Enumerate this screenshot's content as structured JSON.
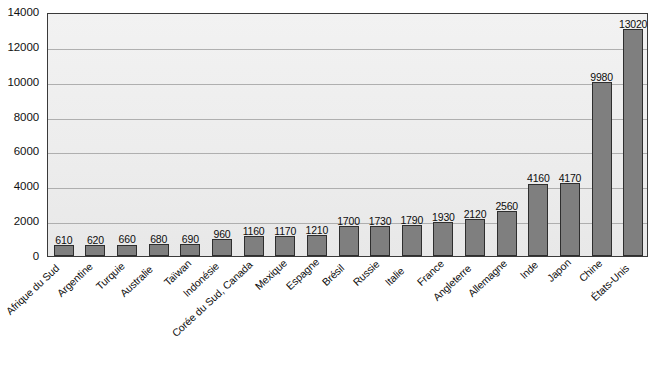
{
  "chart_data": {
    "type": "bar",
    "title": "",
    "subtitle": "",
    "xlabel": "",
    "ylabel": "",
    "ylim": [
      0,
      14000
    ],
    "ytick_values": [
      0,
      2000,
      4000,
      6000,
      8000,
      10000,
      12000,
      14000
    ],
    "ytick_labels": [
      "0",
      "2000",
      "4000",
      "6000",
      "8000",
      "10000",
      "12000",
      "14000"
    ],
    "grid": true,
    "legend": null,
    "legend_position": "none",
    "orientation": "vertical",
    "bar_color": "#7f7f7f",
    "bar_edge_color": "#2e2e2e",
    "plot_background": "#ececec",
    "gridline_color": "#9a9a9a",
    "axis_border_color": "#3a3a3a",
    "text_color": "#0d0d0d",
    "show_value_labels": true,
    "categories": [
      "Afrique du Sud",
      "Argentine",
      "Turquie",
      "Australie",
      "Taïwan",
      "Indonésie",
      "Corée du Sud, Canada",
      "Mexique",
      "Espagne",
      "Brésil",
      "Russie",
      "Italie",
      "France",
      "Angleterre",
      "Allemagne",
      "Inde",
      "Japon",
      "Chine",
      "États-Unis"
    ],
    "values": [
      610,
      620,
      660,
      680,
      690,
      960,
      1160,
      1170,
      1210,
      1700,
      1730,
      1790,
      1930,
      2120,
      2560,
      4160,
      4170,
      9980,
      13020
    ],
    "value_labels": [
      "610",
      "620",
      "660",
      "680",
      "690",
      "960",
      "1160",
      "1170",
      "1210",
      "1700",
      "1730",
      "1790",
      "1930",
      "2120",
      "2560",
      "4160",
      "4170",
      "9980",
      "13020"
    ]
  }
}
